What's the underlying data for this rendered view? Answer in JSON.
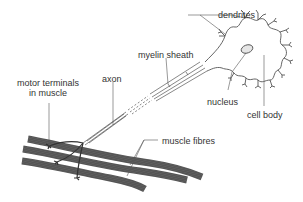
{
  "diagram": {
    "labels": {
      "dendrites": "dendrites",
      "myelin_sheath": "myelin sheath",
      "axon": "axon",
      "motor_terminals_line1": "motor terminals",
      "motor_terminals_line2": "in muscle",
      "nucleus": "nucleus",
      "cell_body": "cell body",
      "muscle_fibres": "muscle fibres"
    },
    "colors": {
      "line": "#555555",
      "text": "#333333",
      "nucleus_fill": "#e6e6e6",
      "background": "#ffffff"
    }
  }
}
